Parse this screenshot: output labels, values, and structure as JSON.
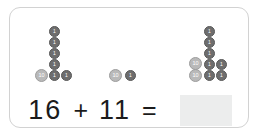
{
  "card": {
    "background_color": "#ffffff",
    "border_color": "#d2d2d2"
  },
  "problem": {
    "type": "addition-with-base-ten-counters",
    "addend_1": "16",
    "addend_2": "11",
    "plus_sign": "+",
    "equals_sign": "=",
    "answer": "",
    "answer_placeholder": ""
  },
  "colors": {
    "ones_coin": "#6e6e6e",
    "tens_coin": "#b9b9b9",
    "answer_box": "#eceded",
    "text": "#1b1b1b"
  },
  "counter_groups": [
    {
      "name": "first-addend-counters",
      "represents": "16",
      "tens_count": 1,
      "ones_count": 6,
      "coins": [
        {
          "value": "1",
          "denomination": "one",
          "x": 39,
          "y": 18
        },
        {
          "value": "1",
          "denomination": "one",
          "x": 39,
          "y": 29
        },
        {
          "value": "1",
          "denomination": "one",
          "x": 39,
          "y": 40
        },
        {
          "value": "1",
          "denomination": "one",
          "x": 39,
          "y": 51
        },
        {
          "value": "1",
          "denomination": "one",
          "x": 39,
          "y": 62
        },
        {
          "value": "10",
          "denomination": "ten",
          "x": 25,
          "y": 61
        },
        {
          "value": "1",
          "denomination": "one",
          "x": 51,
          "y": 62
        }
      ]
    },
    {
      "name": "second-addend-counters",
      "represents": "11",
      "tens_count": 1,
      "ones_count": 1,
      "coins": [
        {
          "value": "10",
          "denomination": "ten",
          "x": 99,
          "y": 61
        },
        {
          "value": "1",
          "denomination": "one",
          "x": 115,
          "y": 62
        }
      ]
    },
    {
      "name": "sum-counters",
      "represents": "27",
      "tens_count": 2,
      "ones_count": 7,
      "coins": [
        {
          "value": "1",
          "denomination": "one",
          "x": 194,
          "y": 18
        },
        {
          "value": "1",
          "denomination": "one",
          "x": 194,
          "y": 29
        },
        {
          "value": "1",
          "denomination": "one",
          "x": 194,
          "y": 40
        },
        {
          "value": "1",
          "denomination": "one",
          "x": 194,
          "y": 51
        },
        {
          "value": "1",
          "denomination": "one",
          "x": 194,
          "y": 62
        },
        {
          "value": "10",
          "denomination": "ten",
          "x": 179,
          "y": 49
        },
        {
          "value": "10",
          "denomination": "ten",
          "x": 179,
          "y": 61
        },
        {
          "value": "1",
          "denomination": "one",
          "x": 206,
          "y": 51
        },
        {
          "value": "1",
          "denomination": "one",
          "x": 206,
          "y": 62
        }
      ]
    }
  ]
}
